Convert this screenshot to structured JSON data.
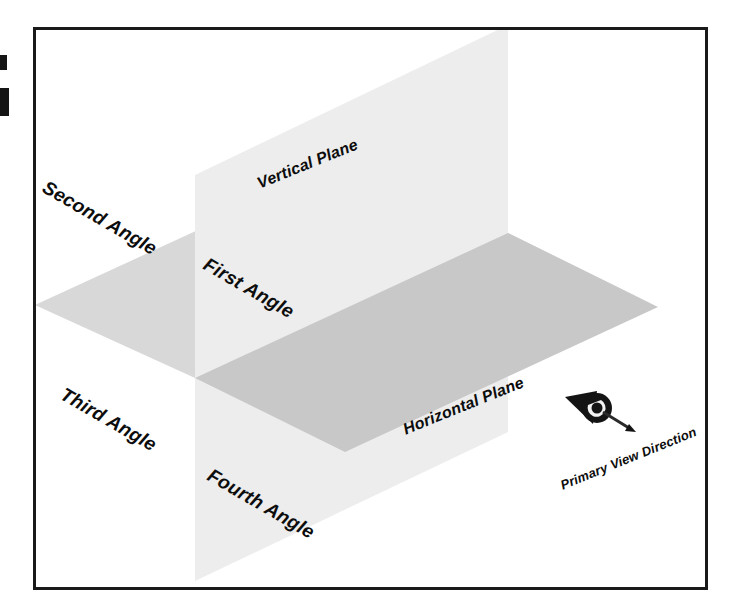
{
  "frame": {
    "border_color": "#1a1a1a"
  },
  "planes": {
    "vertical": {
      "label": "Vertical Plane",
      "fill": "#ededed"
    },
    "horizontal": {
      "label": "Horizontal Plane",
      "fill_rear": "#d8d8d8",
      "fill_front": "#c8c8c8"
    }
  },
  "quadrants": [
    {
      "id": "first",
      "label": "First Angle"
    },
    {
      "id": "second",
      "label": "Second Angle"
    },
    {
      "id": "third",
      "label": "Third Angle"
    },
    {
      "id": "fourth",
      "label": "Fourth Angle"
    }
  ],
  "view_direction": {
    "label": "Primary View Direction",
    "icon": "eye-arrow-icon",
    "color": "#111111"
  },
  "colors": {
    "ink": "#0d0d0d",
    "frame": "#1a1a1a",
    "plane_light": "#ededed",
    "plane_mid": "#d8d8d8",
    "plane_dark": "#c8c8c8",
    "background": "#ffffff"
  }
}
